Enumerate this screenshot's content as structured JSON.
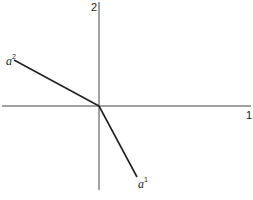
{
  "diagram": {
    "axes": {
      "vertical_label": "2",
      "horizontal_label": "1",
      "origin": [
        99,
        106
      ]
    },
    "vectors": [
      {
        "name": "a",
        "superscript": "2",
        "end": [
          14,
          60
        ]
      },
      {
        "name": "a",
        "superscript": "1",
        "end": [
          137,
          177
        ]
      }
    ],
    "colors": {
      "axis": "#333333",
      "vector": "#222222",
      "background": "#ffffff"
    }
  }
}
